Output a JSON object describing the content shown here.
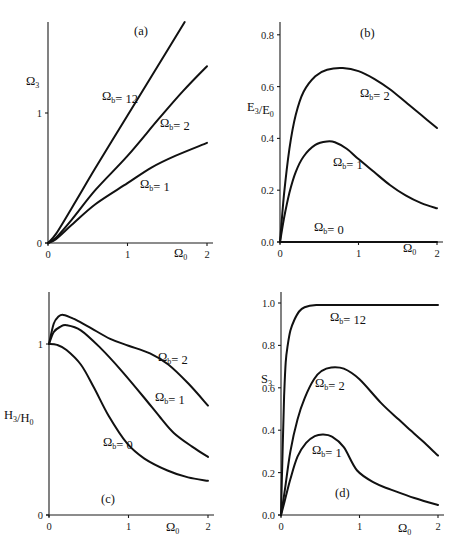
{
  "chart_data": [
    {
      "id": "a",
      "type": "line",
      "panel_label": "(a)",
      "xlabel": "Ω0",
      "ylabel": "Ω3",
      "xlim": [
        0,
        2
      ],
      "ylim": [
        0,
        1.7
      ],
      "xticks": [
        0,
        1,
        2
      ],
      "yticks": [
        0,
        1
      ],
      "ytick_labels": [
        "0",
        "1"
      ],
      "grid": false,
      "frame": {
        "x0": 48,
        "x1": 207,
        "y0": 243,
        "yTopAxis": 22,
        "yUnitPx": 130
      },
      "label_positions": {
        "panel": [
          134,
          35
        ],
        "xlabel": [
          174,
          257
        ],
        "ylabel": [
          26,
          85
        ]
      },
      "series": [
        {
          "name": "Ωb= 12",
          "label_pos": [
            102,
            100
          ],
          "x": [
            0,
            0.1,
            0.3,
            0.6,
            1.0,
            1.3,
            1.72
          ],
          "y": [
            0,
            0.07,
            0.27,
            0.58,
            0.98,
            1.28,
            1.7
          ]
        },
        {
          "name": "Ωb= 2",
          "label_pos": [
            160,
            127
          ],
          "x": [
            0,
            0.1,
            0.3,
            0.6,
            1.0,
            1.4,
            1.7,
            2.0
          ],
          "y": [
            0,
            0.04,
            0.18,
            0.41,
            0.67,
            0.96,
            1.17,
            1.36
          ]
        },
        {
          "name": "Ωb= 1",
          "label_pos": [
            140,
            188
          ],
          "x": [
            0,
            0.1,
            0.3,
            0.6,
            1.0,
            1.3,
            1.6,
            2.0
          ],
          "y": [
            0,
            0.03,
            0.14,
            0.3,
            0.46,
            0.58,
            0.67,
            0.77
          ]
        }
      ]
    },
    {
      "id": "b",
      "type": "line",
      "panel_label": "(b)",
      "xlabel": "Ω0",
      "ylabel": "E3/E0",
      "xlim": [
        0,
        2
      ],
      "ylim": [
        0,
        0.85
      ],
      "xticks": [
        0,
        1,
        2
      ],
      "yticks": [
        0,
        0.2,
        0.4,
        0.6,
        0.8
      ],
      "ytick_labels": [
        "0.0",
        "0.2",
        "0.4",
        "0.6",
        "0.8"
      ],
      "grid": false,
      "frame": {
        "x0": 280,
        "x1": 437,
        "y0": 242,
        "yTopAxis": 22,
        "yUnitPx": 259
      },
      "label_positions": {
        "panel": [
          360,
          37
        ],
        "xlabel": [
          403,
          252
        ],
        "ylabel": [
          247,
          111
        ]
      },
      "series": [
        {
          "name": "Ωb= 2",
          "label_pos": [
            360,
            97
          ],
          "x": [
            0,
            0.05,
            0.12,
            0.2,
            0.3,
            0.45,
            0.6,
            0.8,
            1.0,
            1.2,
            1.4,
            1.6,
            1.8,
            2.0
          ],
          "y": [
            0,
            0.18,
            0.36,
            0.49,
            0.58,
            0.64,
            0.665,
            0.672,
            0.66,
            0.63,
            0.59,
            0.54,
            0.49,
            0.44
          ]
        },
        {
          "name": "Ωb= 1",
          "label_pos": [
            333,
            166
          ],
          "x": [
            0,
            0.05,
            0.12,
            0.2,
            0.3,
            0.45,
            0.6,
            0.7,
            0.85,
            1.0,
            1.2,
            1.4,
            1.6,
            1.8,
            2.0
          ],
          "y": [
            0,
            0.09,
            0.19,
            0.27,
            0.33,
            0.375,
            0.388,
            0.385,
            0.36,
            0.32,
            0.27,
            0.22,
            0.18,
            0.15,
            0.13
          ]
        },
        {
          "name": "Ωb= 0",
          "label_pos": [
            314,
            231
          ],
          "x": [
            0,
            2
          ],
          "y": [
            0,
            0
          ]
        }
      ]
    },
    {
      "id": "c",
      "type": "line",
      "panel_label": "(c)",
      "xlabel": "Ω0",
      "ylabel": "H3/H0",
      "xlim": [
        0,
        2
      ],
      "ylim": [
        0,
        1.3
      ],
      "xticks": [
        0,
        1,
        2
      ],
      "yticks": [
        0,
        1
      ],
      "ytick_labels": [
        "0",
        "1"
      ],
      "grid": false,
      "frame": {
        "x0": 49,
        "x1": 208,
        "y0": 515,
        "yTopAxis": 292,
        "yUnitPx": 171
      },
      "label_positions": {
        "panel": [
          101,
          503
        ],
        "xlabel": [
          166,
          531
        ],
        "ylabel": [
          4,
          419
        ]
      },
      "series": [
        {
          "name": "Ωb= 2",
          "label_pos": [
            158,
            361
          ],
          "x": [
            0,
            0.06,
            0.12,
            0.18,
            0.3,
            0.5,
            0.77,
            1.0,
            1.27,
            1.5,
            1.75,
            2.0
          ],
          "y": [
            1.0,
            1.12,
            1.16,
            1.17,
            1.15,
            1.1,
            1.03,
            0.99,
            0.945,
            0.88,
            0.77,
            0.64
          ]
        },
        {
          "name": "Ωb= 1",
          "label_pos": [
            155,
            401
          ],
          "x": [
            0,
            0.06,
            0.14,
            0.22,
            0.4,
            0.64,
            0.9,
            1.19,
            1.4,
            1.57,
            1.8,
            2.0
          ],
          "y": [
            1.0,
            1.07,
            1.1,
            1.11,
            1.08,
            0.98,
            0.85,
            0.69,
            0.57,
            0.48,
            0.4,
            0.34
          ]
        },
        {
          "name": "Ωb= 0",
          "label_pos": [
            103,
            446
          ],
          "x": [
            0,
            0.1,
            0.22,
            0.4,
            0.56,
            0.75,
            0.98,
            1.2,
            1.49,
            1.75,
            2.0
          ],
          "y": [
            1.0,
            0.995,
            0.965,
            0.88,
            0.75,
            0.58,
            0.42,
            0.33,
            0.26,
            0.22,
            0.2
          ]
        }
      ]
    },
    {
      "id": "d",
      "type": "line",
      "panel_label": "(d)",
      "xlabel": "Ω0",
      "ylabel": "S3",
      "xlim": [
        0,
        2
      ],
      "ylim": [
        0,
        1.05
      ],
      "xticks": [
        0,
        1,
        2
      ],
      "yticks": [
        0,
        0.2,
        0.4,
        0.6,
        0.8,
        1.0
      ],
      "ytick_labels": [
        "0.0",
        "0.2",
        "0.4",
        "0.6",
        "0.8",
        "1.0"
      ],
      "grid": false,
      "frame": {
        "x0": 281,
        "x1": 438,
        "y0": 515,
        "yTopAxis": 292,
        "yUnitPx": 212
      },
      "label_positions": {
        "panel": [
          335,
          497
        ],
        "xlabel": [
          398,
          532
        ],
        "ylabel": [
          261,
          383
        ]
      },
      "series": [
        {
          "name": "Ωb= 12",
          "label_pos": [
            330,
            321
          ],
          "x": [
            0,
            0.02,
            0.04,
            0.06,
            0.085,
            0.12,
            0.17,
            0.23,
            0.3,
            0.45,
            0.7,
            1.0,
            1.5,
            2.0
          ],
          "y": [
            0,
            0.3,
            0.56,
            0.72,
            0.8,
            0.87,
            0.92,
            0.96,
            0.98,
            0.99,
            0.99,
            0.99,
            0.99,
            0.99
          ]
        },
        {
          "name": "Ωb= 2",
          "label_pos": [
            315,
            387
          ],
          "x": [
            0,
            0.05,
            0.12,
            0.21,
            0.3,
            0.42,
            0.52,
            0.64,
            0.8,
            1.0,
            1.27,
            1.5,
            1.65,
            1.8,
            2.0
          ],
          "y": [
            0,
            0.12,
            0.3,
            0.45,
            0.55,
            0.64,
            0.68,
            0.696,
            0.69,
            0.64,
            0.53,
            0.45,
            0.4,
            0.35,
            0.28
          ]
        },
        {
          "name": "Ωb= 1",
          "label_pos": [
            312,
            454
          ],
          "x": [
            0,
            0.05,
            0.12,
            0.21,
            0.32,
            0.43,
            0.53,
            0.65,
            0.8,
            0.97,
            1.2,
            1.4,
            1.7,
            2.0
          ],
          "y": [
            0,
            0.07,
            0.17,
            0.275,
            0.34,
            0.372,
            0.38,
            0.37,
            0.32,
            0.21,
            0.15,
            0.12,
            0.08,
            0.047
          ]
        }
      ]
    }
  ]
}
